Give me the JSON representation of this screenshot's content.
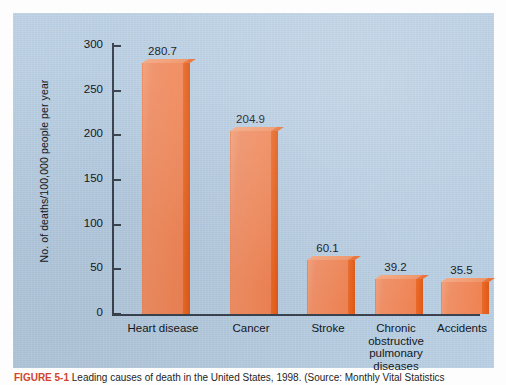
{
  "figure": {
    "panel_bg_color": "#b8cfe3",
    "page_bg_color": "#fdfdfd",
    "caption_number": "FIGURE 5-1",
    "caption_text": "Leading causes of death in the United States, 1998. (Source: Monthly Vital Statistics"
  },
  "chart_data": {
    "type": "bar",
    "title": "",
    "xlabel": "",
    "ylabel": "No. of deaths/100,000 people per year",
    "categories": [
      "Heart disease",
      "Cancer",
      "Stroke",
      "Chronic obstructive pulmonary diseases",
      "Accidents"
    ],
    "category_lines": [
      [
        "Heart disease"
      ],
      [
        "Cancer"
      ],
      [
        "Stroke"
      ],
      [
        "Chronic",
        "obstructive",
        "pulmonary",
        "diseases"
      ],
      [
        "Accidents"
      ]
    ],
    "values": [
      280.7,
      204.9,
      60.1,
      39.2,
      35.5
    ],
    "value_labels": [
      "280.7",
      "204.9",
      "60.1",
      "39.2",
      "35.5"
    ],
    "ylim": [
      0,
      300
    ],
    "yticks": [
      0,
      50,
      100,
      150,
      200,
      250,
      300
    ],
    "ytick_labels": [
      "0",
      "50",
      "100",
      "150",
      "200",
      "250",
      "300"
    ],
    "grid": false,
    "legend": false,
    "bar_face_color": "#f08a5d",
    "bar_side_color": "#e4601c",
    "axis_color": "#3a434f"
  }
}
